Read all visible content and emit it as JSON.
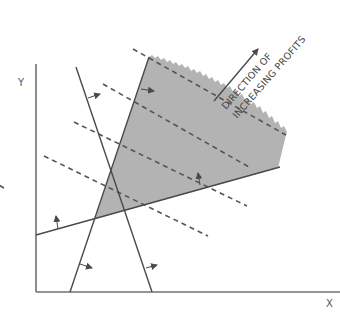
{
  "diagram": {
    "axes": {
      "x_label": "X",
      "y_label": "Y"
    },
    "annotation": {
      "line1": "DIRECTION OF",
      "line2": "INCREASING PROFITS"
    },
    "colors": {
      "feasible_region": "#b3b3b3",
      "lines": "#4a4a4a",
      "axes": "#707070",
      "background": "#ffffff"
    },
    "elements": {
      "constraint_lines": 3,
      "iso_profit_lines": 5,
      "feasible_region": "shaded triangle"
    }
  }
}
